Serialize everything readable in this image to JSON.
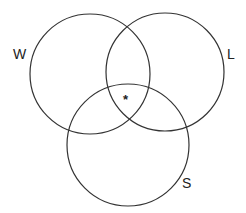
{
  "diagram": {
    "type": "venn",
    "sets": [
      {
        "id": "W",
        "label": "W",
        "cx": 90,
        "cy": 74,
        "r": 60
      },
      {
        "id": "L",
        "label": "L",
        "cx": 165,
        "cy": 72,
        "r": 59
      },
      {
        "id": "S",
        "label": "S",
        "cx": 128,
        "cy": 145,
        "r": 61
      }
    ],
    "marker": {
      "symbol": "*",
      "region": "W ∩ L ∩ S"
    },
    "stroke_color": "#333333"
  }
}
